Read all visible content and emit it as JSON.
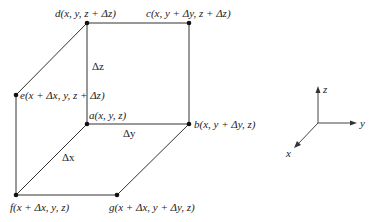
{
  "diagram": {
    "nodes": {
      "a": {
        "letter": "a",
        "label": "a(x, y, z)",
        "x": 87,
        "y": 124
      },
      "b": {
        "letter": "b",
        "label": "b(x, y + Δy, z)",
        "x": 189,
        "y": 124
      },
      "c": {
        "letter": "c",
        "label": "c(x, y + Δy, z + Δz)",
        "x": 189,
        "y": 23
      },
      "d": {
        "letter": "d",
        "label": "d(x, y, z + Δz)",
        "x": 87,
        "y": 23
      },
      "e": {
        "letter": "e",
        "label": "e(x + Δx, y, z + Δz)",
        "x": 16,
        "y": 95
      },
      "f": {
        "letter": "f",
        "label": "f(x + Δx, y, z)",
        "x": 16,
        "y": 195
      },
      "g": {
        "letter": "g",
        "label": "g(x + Δx, y + Δy, z)",
        "x": 117,
        "y": 195
      }
    },
    "edge_labels": {
      "dz": "Δz",
      "dy": "Δy",
      "dx": "Δx"
    },
    "axes": {
      "x": "x",
      "y": "y",
      "z": "z"
    }
  }
}
